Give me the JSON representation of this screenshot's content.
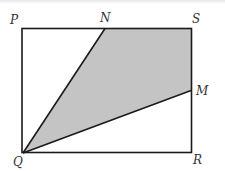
{
  "diagram": {
    "type": "geometry",
    "colors": {
      "line": "#1a1a1a",
      "shade": "#c4c4c4",
      "background": "#ffffff",
      "label": "#333333"
    },
    "points": {
      "P": {
        "label": "P",
        "x": 22,
        "y": 29
      },
      "N": {
        "label": "N",
        "x": 105,
        "y": 28
      },
      "S": {
        "label": "S",
        "x": 191,
        "y": 28
      },
      "M": {
        "label": "M",
        "x": 191,
        "y": 91
      },
      "Q": {
        "label": "Q",
        "x": 23,
        "y": 153
      },
      "R": {
        "label": "R",
        "x": 192,
        "y": 152
      }
    },
    "segments": [
      "PS",
      "SR",
      "RQ",
      "QP",
      "QN",
      "QM"
    ],
    "shaded_region": [
      "Q",
      "N",
      "S",
      "M"
    ]
  }
}
